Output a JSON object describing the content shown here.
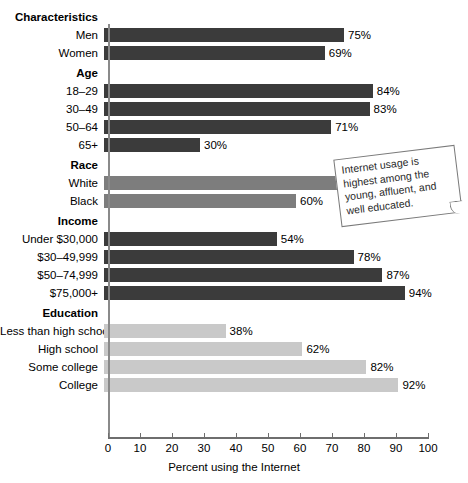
{
  "chart_data": {
    "type": "bar",
    "orientation": "horizontal",
    "title": "",
    "xlabel": "Percent using the Internet",
    "ylabel": "",
    "xlim": [
      0,
      100
    ],
    "xticks": [
      0,
      10,
      20,
      30,
      40,
      50,
      60,
      70,
      80,
      90,
      100
    ],
    "grid": false,
    "legend": null,
    "value_suffix": "%",
    "groups": [
      {
        "header": "Characteristics",
        "color": "#3b3b3b",
        "rows": [
          {
            "label": "Men",
            "value": 75,
            "value_label": "75%"
          },
          {
            "label": "Women",
            "value": 69,
            "value_label": "69%"
          }
        ]
      },
      {
        "header": "Age",
        "color": "#3b3b3b",
        "rows": [
          {
            "label": "18–29",
            "value": 84,
            "value_label": "84%"
          },
          {
            "label": "30–49",
            "value": 83,
            "value_label": "83%"
          },
          {
            "label": "50–64",
            "value": 71,
            "value_label": "71%"
          },
          {
            "label": "65+",
            "value": 30,
            "value_label": "30%"
          }
        ]
      },
      {
        "header": "Race",
        "color": "#7d7d7d",
        "rows": [
          {
            "label": "White",
            "value": 73,
            "value_label": "73%"
          },
          {
            "label": "Black",
            "value": 60,
            "value_label": "60%"
          }
        ]
      },
      {
        "header": "Income",
        "color": "#3b3b3b",
        "rows": [
          {
            "label": "Under $30,000",
            "value": 54,
            "value_label": "54%"
          },
          {
            "label": "$30–49,999",
            "value": 78,
            "value_label": "78%"
          },
          {
            "label": "$50–74,999",
            "value": 87,
            "value_label": "87%"
          },
          {
            "label": "$75,000+",
            "value": 94,
            "value_label": "94%"
          }
        ]
      },
      {
        "header": "Education",
        "color": "#c9c9c9",
        "rows": [
          {
            "label": "Less than high school",
            "value": 38,
            "value_label": "38%"
          },
          {
            "label": "High school",
            "value": 62,
            "value_label": "62%"
          },
          {
            "label": "Some college",
            "value": 82,
            "value_label": "82%"
          },
          {
            "label": "College",
            "value": 92,
            "value_label": "92%"
          }
        ]
      }
    ]
  },
  "callout": {
    "text": "Internet usage is highest among the young, affluent, and well educated."
  }
}
